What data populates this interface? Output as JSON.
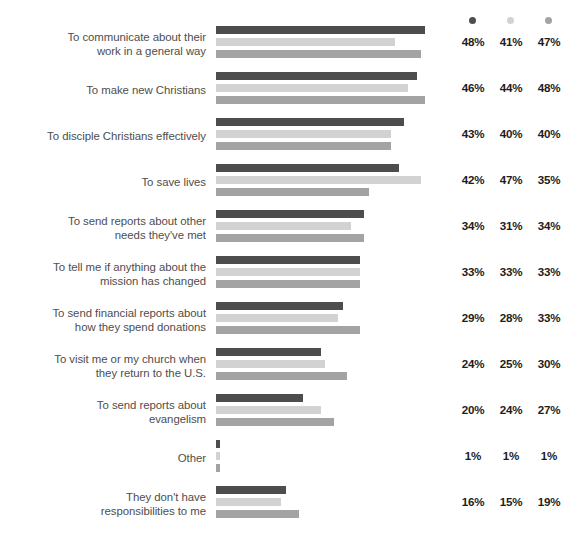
{
  "legend": {
    "series_names": [
      "series-1-dark",
      "series-2-light",
      "series-3-medium"
    ],
    "dot_icons": [
      "legend-dot-icon",
      "legend-dot-icon",
      "legend-dot-icon"
    ]
  },
  "colors": {
    "series_1": "#4d4d4d",
    "series_2": "#d2d2d2",
    "series_3": "#a3a3a3",
    "label_text": "#4e4e4e",
    "value_text": "#1d1d1d",
    "background": "#ffffff"
  },
  "chart_data": {
    "type": "bar",
    "title": "",
    "subtitle": "",
    "xlabel": "",
    "ylabel": "",
    "orientation": "horizontal",
    "grouped": true,
    "grid": false,
    "legend_position": "top-right",
    "xlim": [
      0,
      55
    ],
    "value_suffix": "%",
    "categories": [
      "To communicate about their work in a general way",
      "To make new Christians",
      "To disciple Christians effectively",
      "To save lives",
      "To send reports about other needs they've met",
      "To tell me if anything about the mission has changed",
      "To send financial reports about how they spend donations",
      "To visit me or my church when they return to the U.S.",
      "To send reports about evangelism",
      "Other",
      "They don't have responsibilities to me"
    ],
    "category_lines": [
      [
        "To communicate about their",
        "work in a general way"
      ],
      [
        "To make new Christians"
      ],
      [
        "To disciple Christians effectively"
      ],
      [
        "To save lives"
      ],
      [
        "To send reports about other",
        "needs they've met"
      ],
      [
        "To tell me if anything about the",
        "mission has changed"
      ],
      [
        "To send financial reports about",
        "how they spend donations"
      ],
      [
        "To visit me or my church when",
        "they return to the U.S."
      ],
      [
        "To send reports about",
        "evangelism"
      ],
      [
        "Other"
      ],
      [
        "They don't have",
        "responsibilities to me"
      ]
    ],
    "series": [
      {
        "name": "series-1-dark",
        "color": "#4d4d4d",
        "values": [
          48,
          46,
          43,
          42,
          34,
          33,
          29,
          24,
          20,
          1,
          16
        ],
        "labels": [
          "48%",
          "46%",
          "43%",
          "42%",
          "34%",
          "33%",
          "29%",
          "24%",
          "20%",
          "1%",
          "16%"
        ]
      },
      {
        "name": "series-2-light",
        "color": "#d2d2d2",
        "values": [
          41,
          44,
          40,
          47,
          31,
          33,
          28,
          25,
          24,
          1,
          15
        ],
        "labels": [
          "41%",
          "44%",
          "40%",
          "47%",
          "31%",
          "33%",
          "28%",
          "25%",
          "24%",
          "1%",
          "15%"
        ]
      },
      {
        "name": "series-3-medium",
        "color": "#a3a3a3",
        "values": [
          47,
          48,
          40,
          35,
          34,
          33,
          33,
          30,
          27,
          1,
          19
        ],
        "labels": [
          "47%",
          "48%",
          "40%",
          "35%",
          "34%",
          "33%",
          "33%",
          "30%",
          "27%",
          "1%",
          "19%"
        ]
      }
    ]
  }
}
